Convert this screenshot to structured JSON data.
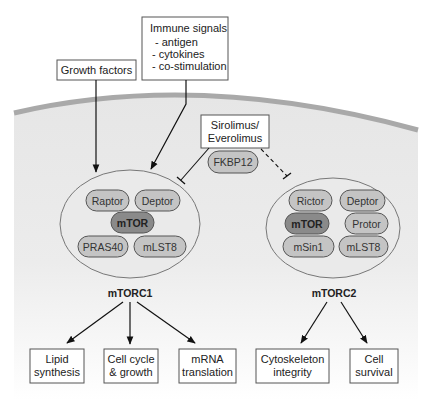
{
  "diagram": {
    "inputs": {
      "growth_factors": "Growth factors",
      "immune_signals": {
        "title": "Immune signals",
        "items": [
          "- antigen",
          "- cytokines",
          "- co-stimulation"
        ]
      },
      "inhibitor": {
        "line1": "Sirolimus/",
        "line2": "Everolimus"
      },
      "fkbp": "FKBP12"
    },
    "mtorc1": {
      "name": "mTORC1",
      "components": [
        "Raptor",
        "Deptor",
        "mTOR",
        "PRAS40",
        "mLST8"
      ],
      "outputs": [
        {
          "line1": "Lipid",
          "line2": "synthesis"
        },
        {
          "line1": "Cell cycle",
          "line2": "& growth"
        },
        {
          "line1": "mRNA",
          "line2": "translation"
        }
      ]
    },
    "mtorc2": {
      "name": "mTORC2",
      "components": [
        "Rictor",
        "Deptor",
        "mTOR",
        "Protor",
        "mSin1",
        "mLST8"
      ],
      "outputs": [
        {
          "line1": "Cytoskeleton",
          "line2": "integrity"
        },
        {
          "line1": "Cell",
          "line2": "survival"
        }
      ]
    },
    "colors": {
      "membrane": "#a9a9a9",
      "cytoplasm": "#e8e8e8",
      "pill": "#c4c4c4",
      "mtor_pill": "#8a8a8a",
      "outline": "#555555"
    }
  }
}
